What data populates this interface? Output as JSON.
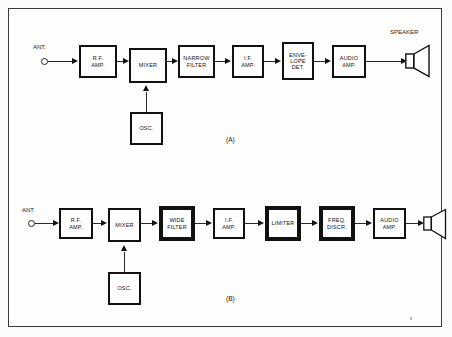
{
  "figure": {
    "caption_a": "(A)",
    "caption_b": "(B)"
  },
  "colors": {
    "ink": "#111111",
    "wire": "#2b2b2b",
    "page": "#fbfbfa",
    "panel": "#fdfdfc",
    "frame": "#3a3a3a"
  },
  "diagram_a": {
    "name": "AM receiver chain",
    "antenna_label": "ANT.",
    "speaker_label": "SPEAKER",
    "caption": "(A)",
    "blocks": [
      {
        "id": "rf-amp",
        "lines": [
          "R.F.",
          "AMP."
        ],
        "emphasis": "normal"
      },
      {
        "id": "mixer",
        "lines": [
          "MIXER"
        ],
        "emphasis": "normal"
      },
      {
        "id": "narrow-filter",
        "lines": [
          "NARROW",
          "FILTER"
        ],
        "emphasis": "normal"
      },
      {
        "id": "if-amp",
        "lines": [
          "I.F.",
          "AMP."
        ],
        "emphasis": "normal"
      },
      {
        "id": "envelope-det",
        "lines": [
          "ENVE-",
          "LOPE",
          "DET."
        ],
        "emphasis": "normal"
      },
      {
        "id": "audio-amp",
        "lines": [
          "AUDIO",
          "AMP."
        ],
        "emphasis": "normal"
      },
      {
        "id": "osc",
        "lines": [
          "OSC."
        ],
        "emphasis": "normal"
      }
    ]
  },
  "diagram_b": {
    "name": "FM receiver chain",
    "antenna_label": "ANT.",
    "speaker_label": "",
    "caption": "(B)",
    "blocks": [
      {
        "id": "rf-amp",
        "lines": [
          "R.F.",
          "AMP."
        ],
        "emphasis": "normal"
      },
      {
        "id": "mixer",
        "lines": [
          "MIXER"
        ],
        "emphasis": "normal"
      },
      {
        "id": "wide-filter",
        "lines": [
          "WIDE",
          "FILTER"
        ],
        "emphasis": "thick"
      },
      {
        "id": "if-amp",
        "lines": [
          "I.F.",
          "AMP."
        ],
        "emphasis": "normal"
      },
      {
        "id": "limiter",
        "lines": [
          "LIMITER"
        ],
        "emphasis": "thick"
      },
      {
        "id": "freq-discr",
        "lines": [
          "FREQ.",
          "DISCR."
        ],
        "emphasis": "thick"
      },
      {
        "id": "audio-amp",
        "lines": [
          "AUDIO",
          "AMP."
        ],
        "emphasis": "normal"
      },
      {
        "id": "osc",
        "lines": [
          "OSC."
        ],
        "emphasis": "normal"
      }
    ]
  }
}
